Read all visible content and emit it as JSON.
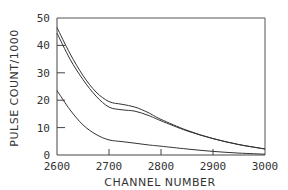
{
  "chart_data": {
    "type": "line",
    "title": "",
    "xlabel": "CHANNEL NUMBER",
    "ylabel": "PULSE COUNT/1000",
    "xlim": [
      2600,
      3000
    ],
    "ylim": [
      0,
      50
    ],
    "grid": false,
    "legend": null,
    "x_ticks": [
      2600,
      2700,
      2800,
      2900,
      3000
    ],
    "y_ticks": [
      0,
      10,
      20,
      30,
      40,
      50
    ],
    "x": [
      2600,
      2625,
      2650,
      2675,
      2700,
      2725,
      2750,
      2775,
      2800,
      2850,
      2900,
      2950,
      3000
    ],
    "series": [
      {
        "name": "upper",
        "values": [
          46.5,
          37,
          29,
          23,
          19.5,
          18.5,
          17.5,
          15.5,
          13,
          9,
          6,
          3.8,
          2.2
        ]
      },
      {
        "name": "middle",
        "values": [
          44.5,
          35,
          27.5,
          21.5,
          17.5,
          16.5,
          16,
          14.5,
          12.5,
          8.8,
          6,
          3.8,
          2.2
        ]
      },
      {
        "name": "lower",
        "values": [
          23.5,
          16.5,
          11,
          7.5,
          5.5,
          4.9,
          4.3,
          3.7,
          3.2,
          2.2,
          1.3,
          0.7,
          0.3
        ]
      }
    ]
  },
  "labels": {
    "xlabel": "CHANNEL NUMBER",
    "ylabel": "PULSE COUNT/1000",
    "x_ticks": [
      "2600",
      "2700",
      "2800",
      "2900",
      "3000"
    ],
    "y_ticks": [
      "0",
      "10",
      "20",
      "30",
      "40",
      "50"
    ]
  }
}
